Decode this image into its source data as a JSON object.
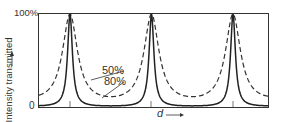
{
  "chart_data": {
    "type": "line",
    "title": "",
    "xlabel": "d",
    "ylabel": "Intensity transmitted",
    "y_ticks": [
      "0",
      "100%"
    ],
    "ylim": [
      0,
      100
    ],
    "grid": false,
    "legend": "inline annotations",
    "annotations": [
      "50%",
      "80%"
    ],
    "peak_positions": [
      1,
      2,
      3
    ],
    "series": [
      {
        "name": "50%",
        "style": "dashed",
        "reflectivity": 0.5,
        "min_value": 11,
        "max_value": 100
      },
      {
        "name": "80%",
        "style": "solid",
        "reflectivity": 0.8,
        "min_value": 1.2,
        "max_value": 100
      }
    ]
  },
  "labels": {
    "y_top": "100%",
    "y_bottom": "0",
    "y_axis": "Intensity transmitted",
    "y_arrow": "↑",
    "x_axis": "d",
    "x_arrow": "⟶",
    "series_50": "50%",
    "series_80": "80%"
  }
}
